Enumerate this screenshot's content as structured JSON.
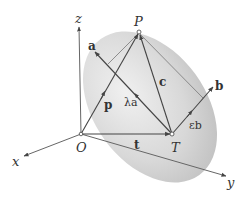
{
  "diagram": {
    "type": "3d-vector-plane",
    "axes": {
      "x_label": "x",
      "y_label": "y",
      "z_label": "z"
    },
    "points": {
      "origin": "O",
      "P": "P",
      "T": "T"
    },
    "vectors": {
      "p": "p",
      "t": "t",
      "c": "c",
      "a": "a",
      "b": "b",
      "lambda_a": "λa",
      "epsilon_b": "εb"
    },
    "colors": {
      "plane_fill": "#d4d4d4",
      "line": "#555555",
      "text": "#333333"
    }
  }
}
